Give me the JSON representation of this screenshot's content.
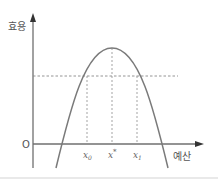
{
  "diagram": {
    "y_axis_label": "효용",
    "x_axis_label": "예산",
    "origin_label": "O",
    "x_ticks": [
      {
        "base": "x",
        "sub": "0"
      },
      {
        "base": "x",
        "sup": "*"
      },
      {
        "base": "x",
        "sub": "1"
      }
    ],
    "curve": "inverted parabola (utility vs budget) with peak at x*",
    "dashed_level": "utility level shared by x0 and x1",
    "colors": {
      "axis": "#6f6f6f",
      "curve": "#7a7a7a",
      "dashed": "#888888",
      "bottom_rule": "#d4d4d4"
    }
  }
}
